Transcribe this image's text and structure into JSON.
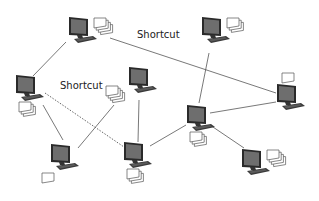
{
  "diagram": {
    "type": "network",
    "width": 319,
    "height": 201,
    "colors": {
      "background": "#ffffff",
      "line": "#555555",
      "monitor_frame": "#2a2a2a",
      "monitor_screen": "#6b6b6b",
      "doc_fill": "#ffffff",
      "doc_stroke": "#555555",
      "label_text": "#222222"
    },
    "labels": [
      {
        "id": "shortcut-top",
        "text": "Shortcut",
        "x": 137,
        "y": 35
      },
      {
        "id": "shortcut-left",
        "text": "Shortcut",
        "x": 60,
        "y": 86
      }
    ],
    "nodes": [
      {
        "id": "A",
        "x": 80,
        "y": 30,
        "docs": 4,
        "doc_pos": "right"
      },
      {
        "id": "B",
        "x": 213,
        "y": 30,
        "docs": 3,
        "doc_pos": "right"
      },
      {
        "id": "C",
        "x": 27,
        "y": 88,
        "docs": 3,
        "doc_pos": "below"
      },
      {
        "id": "D",
        "x": 140,
        "y": 80,
        "docs": 4,
        "doc_pos": "left"
      },
      {
        "id": "E",
        "x": 288,
        "y": 97,
        "docs": 1,
        "doc_pos": "above"
      },
      {
        "id": "F",
        "x": 198,
        "y": 118,
        "docs": 3,
        "doc_pos": "below"
      },
      {
        "id": "G",
        "x": 62,
        "y": 157,
        "docs": 1,
        "doc_pos": "below-left"
      },
      {
        "id": "H",
        "x": 135,
        "y": 155,
        "docs": 3,
        "doc_pos": "below"
      },
      {
        "id": "I",
        "x": 253,
        "y": 162,
        "docs": 4,
        "doc_pos": "right"
      }
    ],
    "edges": [
      {
        "from": "A",
        "to": "C",
        "style": "solid",
        "x1": 66,
        "y1": 42,
        "x2": 33,
        "y2": 76
      },
      {
        "from": "A",
        "to": "E",
        "style": "solid",
        "label": "Shortcut",
        "x1": 110,
        "y1": 38,
        "x2": 276,
        "y2": 93
      },
      {
        "from": "B",
        "to": "F",
        "style": "solid",
        "x1": 209,
        "y1": 53,
        "x2": 199,
        "y2": 103
      },
      {
        "from": "C",
        "to": "G",
        "style": "solid",
        "x1": 43,
        "y1": 105,
        "x2": 63,
        "y2": 140
      },
      {
        "from": "C",
        "to": "H",
        "style": "dotted",
        "label": "Shortcut",
        "x1": 45,
        "y1": 93,
        "x2": 124,
        "y2": 147
      },
      {
        "from": "G",
        "to": "D",
        "style": "solid",
        "x1": 78,
        "y1": 148,
        "x2": 114,
        "y2": 105
      },
      {
        "from": "D",
        "to": "H",
        "style": "solid",
        "x1": 139,
        "y1": 100,
        "x2": 138,
        "y2": 142
      },
      {
        "from": "H",
        "to": "F",
        "style": "solid",
        "x1": 150,
        "y1": 146,
        "x2": 186,
        "y2": 125
      },
      {
        "from": "F",
        "to": "E",
        "style": "solid",
        "x1": 210,
        "y1": 113,
        "x2": 276,
        "y2": 102
      },
      {
        "from": "F",
        "to": "I",
        "style": "solid",
        "x1": 210,
        "y1": 125,
        "x2": 244,
        "y2": 148
      }
    ]
  }
}
